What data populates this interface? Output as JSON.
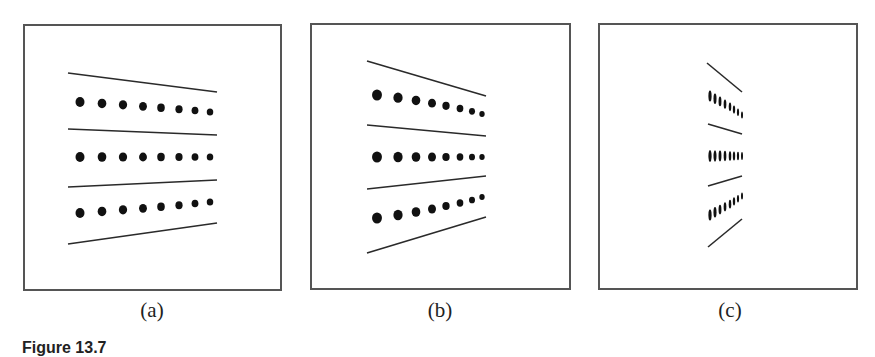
{
  "figure": {
    "caption": "Figure 13.7",
    "panels": [
      {
        "id": "a",
        "label": "(a)",
        "box": [
          23,
          24,
          259,
          267
        ],
        "label_center_x": 152,
        "marker": "dot",
        "lines": [
          [
            [
              68,
              73
            ],
            [
              217,
              92
            ]
          ],
          [
            [
              68,
              129
            ],
            [
              217,
              135
            ]
          ],
          [
            [
              68,
              187
            ],
            [
              217,
              180
            ]
          ],
          [
            [
              68,
              244
            ],
            [
              217,
              223
            ]
          ]
        ],
        "rows": [
          {
            "xs": [
              80,
              102,
              123,
              143,
              161,
              179,
              195,
              210
            ],
            "y_start": 102,
            "y_end": 112,
            "r_start": 5,
            "r_end": 3.6
          },
          {
            "xs": [
              80,
              102,
              123,
              143,
              161,
              179,
              195,
              210
            ],
            "y_start": 157,
            "y_end": 157,
            "r_start": 5,
            "r_end": 3.6
          },
          {
            "xs": [
              80,
              102,
              123,
              143,
              161,
              179,
              195,
              210
            ],
            "y_start": 213,
            "y_end": 202,
            "r_start": 5,
            "r_end": 3.6
          }
        ]
      },
      {
        "id": "b",
        "label": "(b)",
        "box": [
          310,
          23,
          261,
          267
        ],
        "label_center_x": 440,
        "marker": "dot",
        "lines": [
          [
            [
              367,
              61
            ],
            [
              486,
              96
            ]
          ],
          [
            [
              367,
              125
            ],
            [
              486,
              136
            ]
          ],
          [
            [
              367,
              189
            ],
            [
              486,
              176
            ]
          ],
          [
            [
              367,
              253
            ],
            [
              486,
              217
            ]
          ]
        ],
        "rows": [
          {
            "xs": [
              377,
              398,
              416,
              432,
              446,
              460,
              472,
              482
            ],
            "y_start": 95,
            "y_end": 114,
            "r_start": 5.5,
            "r_end": 3
          },
          {
            "xs": [
              377,
              398,
              416,
              432,
              446,
              460,
              472,
              482
            ],
            "y_start": 157,
            "y_end": 157,
            "r_start": 5.5,
            "r_end": 3
          },
          {
            "xs": [
              377,
              398,
              416,
              432,
              446,
              460,
              472,
              482
            ],
            "y_start": 218,
            "y_end": 197,
            "r_start": 5.5,
            "r_end": 3
          }
        ]
      },
      {
        "id": "c",
        "label": "(c)",
        "box": [
          598,
          23,
          260,
          267
        ],
        "label_center_x": 730,
        "marker": "dash",
        "lines": [
          [
            [
              707,
              63
            ],
            [
              742,
              92
            ]
          ],
          [
            [
              708,
              124
            ],
            [
              742,
              134
            ]
          ],
          [
            [
              708,
              186
            ],
            [
              742,
              176
            ]
          ],
          [
            [
              708,
              247
            ],
            [
              742,
              219
            ]
          ]
        ],
        "rows": [
          {
            "xs": [
              710,
              715,
              720,
              725,
              730,
              734,
              738,
              742
            ],
            "y_start": 96,
            "y_end": 115,
            "r_start": 5.5,
            "r_end": 3.5
          },
          {
            "xs": [
              710,
              715,
              720,
              725,
              730,
              734,
              738,
              742
            ],
            "y_start": 156,
            "y_end": 156,
            "r_start": 6,
            "r_end": 4
          },
          {
            "xs": [
              710,
              715,
              720,
              725,
              730,
              734,
              738,
              742
            ],
            "y_start": 215,
            "y_end": 196,
            "r_start": 5.5,
            "r_end": 3.5
          }
        ]
      }
    ],
    "colors": {
      "ink": "#111111",
      "line": "#2a2a2a",
      "border": "#555555"
    }
  }
}
